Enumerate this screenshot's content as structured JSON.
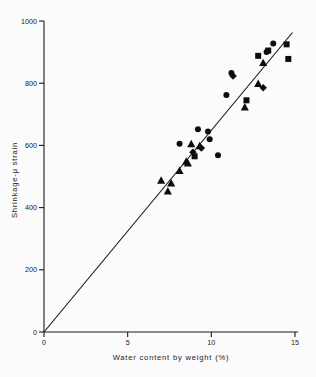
{
  "chart_data": {
    "type": "scatter",
    "title": "",
    "xlabel": "Water content by weight (%)",
    "ylabel": "Shrinkage-μ strain",
    "xlim": [
      0,
      15
    ],
    "ylim": [
      0,
      1000
    ],
    "xticks": [
      0,
      5,
      10,
      15
    ],
    "xticklabels": [
      "0",
      "5",
      "10",
      "15"
    ],
    "yticks": [
      0,
      200,
      400,
      600,
      800,
      1000
    ],
    "yticklabels": [
      "0",
      "200",
      "400",
      "600",
      "800",
      "1000"
    ],
    "grid": false,
    "legend": "none",
    "series": [
      {
        "name": "circle-series",
        "marker": "circle",
        "points": [
          {
            "x": 8.1,
            "y": 605
          },
          {
            "x": 9.2,
            "y": 652
          },
          {
            "x": 9.8,
            "y": 645
          },
          {
            "x": 9.9,
            "y": 620
          },
          {
            "x": 10.4,
            "y": 568
          },
          {
            "x": 10.9,
            "y": 762
          },
          {
            "x": 11.2,
            "y": 833
          },
          {
            "x": 13.3,
            "y": 900
          },
          {
            "x": 13.7,
            "y": 928
          }
        ]
      },
      {
        "name": "triangle-series",
        "marker": "triangle",
        "points": [
          {
            "x": 7.0,
            "y": 487
          },
          {
            "x": 7.4,
            "y": 452
          },
          {
            "x": 7.6,
            "y": 478
          },
          {
            "x": 8.1,
            "y": 518
          },
          {
            "x": 8.5,
            "y": 548
          },
          {
            "x": 8.6,
            "y": 542
          },
          {
            "x": 8.8,
            "y": 604
          },
          {
            "x": 9.3,
            "y": 598
          },
          {
            "x": 12.0,
            "y": 722
          },
          {
            "x": 12.8,
            "y": 798
          },
          {
            "x": 13.1,
            "y": 865
          }
        ]
      },
      {
        "name": "square-series",
        "marker": "square",
        "points": [
          {
            "x": 9.0,
            "y": 565
          },
          {
            "x": 12.1,
            "y": 745
          },
          {
            "x": 12.8,
            "y": 888
          },
          {
            "x": 13.4,
            "y": 905
          },
          {
            "x": 14.5,
            "y": 925
          },
          {
            "x": 14.6,
            "y": 878
          }
        ]
      },
      {
        "name": "diamond-series",
        "marker": "diamond",
        "points": [
          {
            "x": 8.9,
            "y": 578
          },
          {
            "x": 9.4,
            "y": 592
          },
          {
            "x": 11.3,
            "y": 823
          },
          {
            "x": 13.1,
            "y": 785
          }
        ]
      }
    ],
    "fit_line": {
      "name": "regression-line",
      "x0": 0.0,
      "y0": 0,
      "x1": 14.85,
      "y1": 963
    }
  }
}
